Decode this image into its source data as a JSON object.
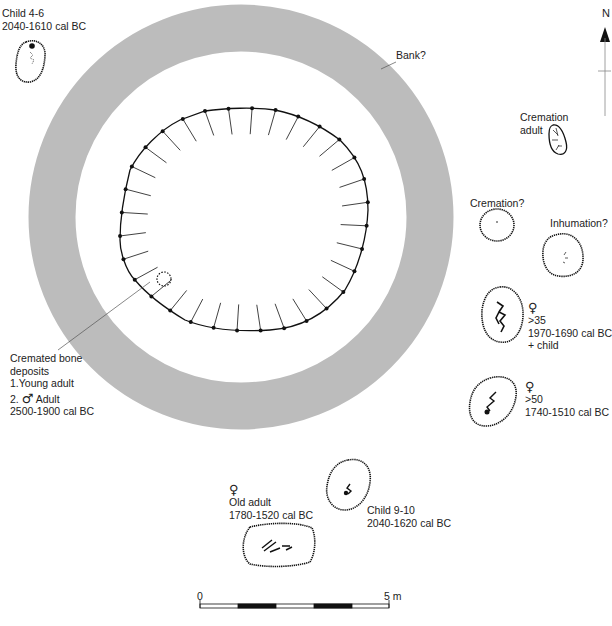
{
  "figure": {
    "colors": {
      "bank": "#bcbcbc",
      "ink": "#111111",
      "label": "#222222",
      "background": "#ffffff"
    },
    "north_arrow": {
      "label": "N"
    },
    "scale_bar": {
      "start_label": "0",
      "end_label": "5 m",
      "segments": 5
    },
    "bank": {
      "label": "Bank?"
    },
    "central_ditch": {
      "label_lines": [
        "Cremated bone",
        "deposits",
        "1.Young adult"
      ],
      "second_line_prefix": "2.",
      "second_symbol": "♂",
      "second_text": "Adult",
      "date": "2500-1900 cal BC"
    },
    "graves": [
      {
        "id": "child-4-6",
        "lines": [
          "Child 4-6",
          "2040-1610 cal BC"
        ]
      },
      {
        "id": "cremation-adult",
        "lines": [
          "Cremation",
          "adult"
        ]
      },
      {
        "id": "cremation-query",
        "lines": [
          "Cremation?"
        ]
      },
      {
        "id": "inhumation-query",
        "lines": [
          "Inhumation?"
        ]
      },
      {
        "id": "female-35",
        "symbol": "♀",
        "lines": [
          ">35",
          "1970-1690 cal BC",
          "+ child"
        ]
      },
      {
        "id": "female-50",
        "symbol": "♀",
        "lines": [
          ">50",
          "1740-1510 cal BC"
        ]
      },
      {
        "id": "child-9-10",
        "lines": [
          "Child 9-10",
          "2040-1620 cal BC"
        ]
      },
      {
        "id": "old-adult",
        "symbol": "♀",
        "lines": [
          "Old adult",
          "1780-1520 cal BC"
        ]
      }
    ]
  }
}
